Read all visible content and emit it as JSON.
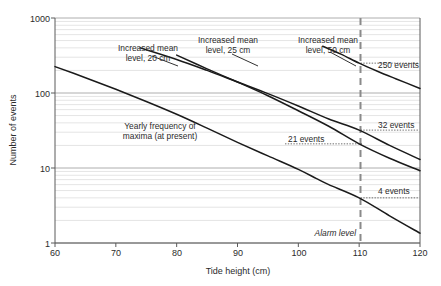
{
  "chart_data": {
    "type": "line",
    "title": "",
    "xlabel": "Tide height (cm)",
    "ylabel": "Number of events",
    "xlim": [
      60,
      120
    ],
    "ylim": [
      1,
      1000
    ],
    "yscale": "log",
    "grid": true,
    "legend_position": "inline-annotations",
    "xticks": [
      "60",
      "70",
      "80",
      "90",
      "100",
      "110",
      "120"
    ],
    "yticks": [
      "1",
      "10",
      "100",
      "1000"
    ],
    "series": [
      {
        "name": "Yearly frequency of maxima (at present)",
        "label_line1": "Yearly frequency of",
        "label_line2": "maxima (at present)",
        "x": [
          60,
          65,
          70,
          75,
          80,
          85,
          90,
          95,
          100,
          103,
          105,
          110,
          115,
          120
        ],
        "y": [
          225,
          160,
          112,
          77,
          52,
          34,
          22,
          14.5,
          9.6,
          7.2,
          6.0,
          4.0,
          2.3,
          1.35
        ]
      },
      {
        "name": "Increased mean level, 20 cm",
        "label_line1": "Increased mean",
        "label_line2": "level, 20 cm",
        "x": [
          74,
          80,
          85,
          90,
          95,
          100,
          105,
          110,
          115,
          120
        ],
        "y": [
          400,
          280,
          200,
          140,
          98,
          67,
          45,
          32,
          20,
          13
        ],
        "value_at_alarm": 32
      },
      {
        "name": "Increased mean level, 25 cm",
        "label_line1": "Increased mean",
        "label_line2": "level, 25 cm",
        "x": [
          80,
          85,
          90,
          95,
          100,
          105,
          110,
          115,
          120
        ],
        "y": [
          320,
          210,
          140,
          92,
          58,
          36,
          21,
          13.5,
          9.2
        ],
        "value_at_alarm": 21
      },
      {
        "name": "Increased mean level, 50 cm",
        "label_line1": "Increased mean",
        "label_line2": "level, 50 cm",
        "x": [
          104,
          107,
          110,
          113,
          116,
          120
        ],
        "y": [
          420,
          330,
          250,
          195,
          155,
          115
        ],
        "value_at_alarm": 250
      }
    ],
    "annotations": [
      {
        "name": "alarm-level",
        "text": "Alarm level",
        "x": 110,
        "italic": true
      },
      {
        "name": "callout-250",
        "text": "250 events",
        "x": 110,
        "y": 250
      },
      {
        "name": "callout-32",
        "text": "32 events",
        "x": 110,
        "y": 32
      },
      {
        "name": "callout-21",
        "text": "21 events",
        "x": 110,
        "y": 21
      },
      {
        "name": "callout-4",
        "text": "4 events",
        "x": 110,
        "y": 4
      }
    ]
  },
  "labels": {
    "y_axis_title": "Number of events",
    "x_axis_title": "Tide height (cm)",
    "x_tick_60": "60",
    "x_tick_70": "70",
    "x_tick_80": "80",
    "x_tick_90": "90",
    "x_tick_100": "100",
    "x_tick_110": "110",
    "x_tick_120": "120",
    "y_tick_1": "1",
    "y_tick_10": "10",
    "y_tick_100": "100",
    "y_tick_1000": "1000",
    "series_20_l1": "Increased mean",
    "series_20_l2": "level, 20 cm",
    "series_25_l1": "Increased mean",
    "series_25_l2": "level, 25 cm",
    "series_50_l1": "Increased mean",
    "series_50_l2": "level, 50 cm",
    "series_present_l1": "Yearly frequency of",
    "series_present_l2": "maxima (at present)",
    "callout_250": "250 events",
    "callout_32": "32 events",
    "callout_21": "21 events",
    "callout_4": "4 events",
    "alarm_level": "Alarm level"
  },
  "colors": {
    "series_stroke": "#1a1a1a",
    "grid_minor": "#d8d8d8",
    "grid_major": "#9a9a9a",
    "axis": "#5a5a5a",
    "alarm": "#8a8a8a",
    "text": "#2b2b2b",
    "background": "#ffffff"
  }
}
